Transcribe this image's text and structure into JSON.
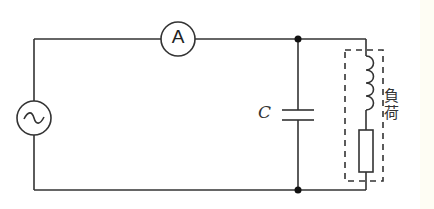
{
  "diagram": {
    "type": "circuit-schematic",
    "components": {
      "source": {
        "symbol": "~",
        "kind": "AC voltage source"
      },
      "ammeter": {
        "symbol": "A",
        "kind": "ammeter"
      },
      "capacitor": {
        "label": "C",
        "kind": "capacitor"
      },
      "load": {
        "label_chars": [
          "負",
          "荷"
        ],
        "label": "負荷",
        "contents": [
          "inductor",
          "resistor"
        ]
      }
    },
    "colors": {
      "wire": "#333333",
      "background": "#ffffff",
      "edge_strip": "#fefdf4"
    }
  }
}
